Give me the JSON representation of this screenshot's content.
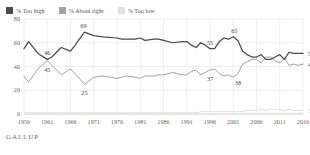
{
  "legend": {
    "items": [
      {
        "label": "% Too high",
        "color": "#4d4a47",
        "icon": "legend-swatch"
      },
      {
        "label": "% About right",
        "color": "#a5a19d",
        "icon": "legend-swatch"
      },
      {
        "label": "% Too low",
        "color": "#e2e0dd",
        "icon": "legend-swatch"
      }
    ]
  },
  "footer": {
    "brand": "GALLUP"
  },
  "chart_data": {
    "type": "line",
    "title": "",
    "subtitle": "",
    "xlabel": "",
    "ylabel": "",
    "xlim": [
      1956,
      2016
    ],
    "ylim": [
      0,
      80
    ],
    "yticks": [
      0,
      20,
      40,
      60,
      80
    ],
    "xticks": [
      1956,
      1961,
      1966,
      1971,
      1976,
      1981,
      1986,
      1991,
      1996,
      2001,
      2006,
      2011,
      2016
    ],
    "grid": "vertical-and-horizontal-light",
    "legend_position": "top-left",
    "series": [
      {
        "name": "% Too high",
        "color": "#4d4a47",
        "x": [
          1956,
          1957,
          1959,
          1961,
          1962,
          1963,
          1964,
          1966,
          1967,
          1969,
          1971,
          1973,
          1976,
          1977,
          1978,
          1980,
          1981,
          1982,
          1984,
          1985,
          1986,
          1988,
          1990,
          1991,
          1992,
          1993,
          1994,
          1995,
          1996,
          1997,
          1998,
          1999,
          2000,
          2001,
          2002,
          2003,
          2004,
          2005,
          2006,
          2007,
          2008,
          2009,
          2010,
          2011,
          2012,
          2013,
          2014,
          2015,
          2016
        ],
        "y": [
          55,
          61,
          51,
          46,
          48,
          52,
          56,
          53,
          58,
          69,
          66,
          65,
          64,
          63,
          63,
          63,
          64,
          62,
          63,
          63,
          62,
          60,
          61,
          61,
          58,
          56,
          60,
          58,
          55,
          55,
          61,
          64,
          63,
          65,
          62,
          53,
          50,
          48,
          48,
          50,
          46,
          46,
          48,
          50,
          46,
          52,
          51,
          51,
          51
        ]
      },
      {
        "name": "% About right",
        "color": "#a5a19d",
        "x": [
          1956,
          1957,
          1959,
          1961,
          1962,
          1963,
          1964,
          1966,
          1967,
          1969,
          1971,
          1973,
          1976,
          1977,
          1978,
          1980,
          1981,
          1982,
          1984,
          1985,
          1986,
          1988,
          1990,
          1991,
          1992,
          1993,
          1994,
          1995,
          1996,
          1997,
          1998,
          1999,
          2000,
          2001,
          2002,
          2003,
          2004,
          2005,
          2006,
          2007,
          2008,
          2009,
          2010,
          2011,
          2012,
          2013,
          2014,
          2015,
          2016
        ],
        "y": [
          32,
          27,
          38,
          45,
          41,
          37,
          33,
          38,
          34,
          25,
          31,
          32,
          30,
          31,
          32,
          31,
          30,
          32,
          32,
          33,
          33,
          35,
          33,
          33,
          36,
          37,
          33,
          35,
          37,
          38,
          34,
          32,
          33,
          31,
          34,
          42,
          44,
          46,
          46,
          43,
          48,
          48,
          45,
          43,
          47,
          41,
          42,
          41,
          42
        ]
      },
      {
        "name": "% Too low",
        "color": "#e2e0dd",
        "x": [
          1956,
          1957,
          1959,
          1961,
          1962,
          1963,
          1964,
          1966,
          1967,
          1969,
          1971,
          1973,
          1976,
          1977,
          1978,
          1980,
          1981,
          1982,
          1984,
          1985,
          1986,
          1988,
          1990,
          1991,
          1992,
          1993,
          1994,
          1995,
          1996,
          1997,
          1998,
          1999,
          2000,
          2001,
          2002,
          2003,
          2004,
          2005,
          2006,
          2007,
          2008,
          2009,
          2010,
          2011,
          2012,
          2013,
          2014,
          2015,
          2016
        ],
        "y": [
          1,
          1,
          1,
          1,
          1,
          1,
          1,
          1,
          1,
          1,
          1,
          1,
          1,
          1,
          1,
          1,
          1,
          1,
          1,
          1,
          1,
          1,
          1,
          1,
          1,
          1,
          2,
          2,
          2,
          2,
          2,
          2,
          2,
          2,
          2,
          2,
          3,
          3,
          3,
          4,
          3,
          4,
          4,
          4,
          3,
          4,
          3,
          3,
          3
        ]
      }
    ],
    "annotations": [
      {
        "text": "46",
        "x": 1961,
        "y": 46,
        "series": "% Too high",
        "dx": 0,
        "dy": -7
      },
      {
        "text": "45",
        "x": 1961,
        "y": 45,
        "series": "% About right",
        "dx": 0,
        "dy": 8
      },
      {
        "text": "69",
        "x": 1969,
        "y": 69,
        "series": "% Too high",
        "dx": -1,
        "dy": -7
      },
      {
        "text": "25",
        "x": 1969,
        "y": 25,
        "series": "% About right",
        "dx": 0,
        "dy": 8
      },
      {
        "text": "55",
        "x": 1996,
        "y": 55,
        "series": "% Too high",
        "dx": 0,
        "dy": -7
      },
      {
        "text": "37",
        "x": 1996,
        "y": 37,
        "series": "% About right",
        "dx": 0,
        "dy": 8
      },
      {
        "text": "65",
        "x": 2001,
        "y": 65,
        "series": "% Too high",
        "dx": 1,
        "dy": -7
      },
      {
        "text": "38",
        "x": 2002,
        "y": 34,
        "series": "% About right",
        "dx": 0,
        "dy": 8
      },
      {
        "text": "51",
        "x": 2016,
        "y": 51,
        "series": "% Too high",
        "dx": 8,
        "dy": 0
      },
      {
        "text": "42",
        "x": 2016,
        "y": 42,
        "series": "% About right",
        "dx": 8,
        "dy": 0
      },
      {
        "text": "3",
        "x": 2016,
        "y": 3,
        "series": "% Too low",
        "dx": 7,
        "dy": 0
      }
    ]
  }
}
